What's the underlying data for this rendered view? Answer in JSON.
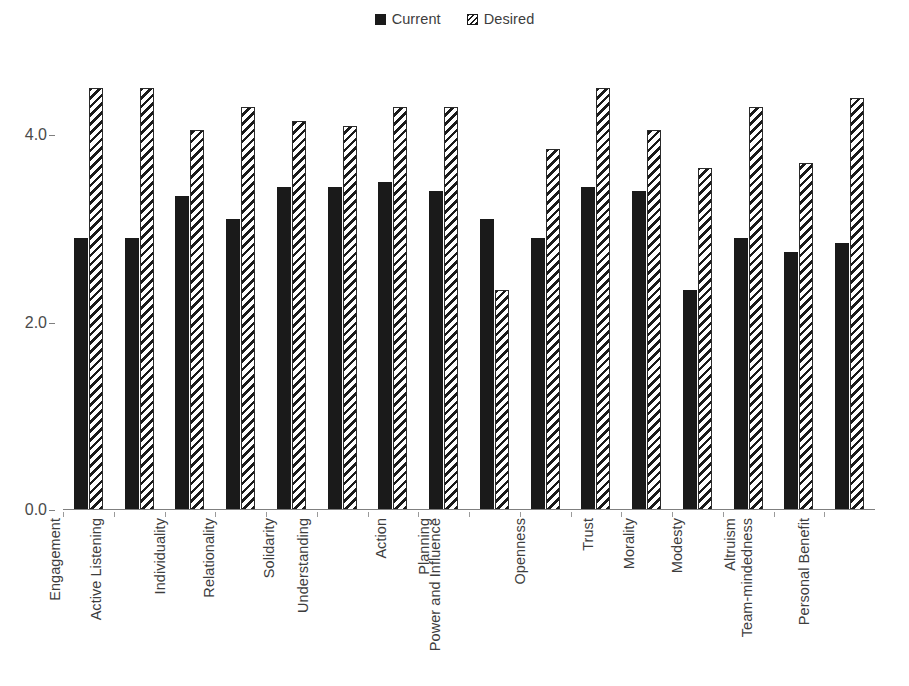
{
  "legend": {
    "position": "top-center",
    "entries": [
      {
        "label": "Current",
        "swatch": "solid-black-square-icon",
        "color": "#1a1a1a"
      },
      {
        "label": "Desired",
        "swatch": "diagonal-hatch-square-icon",
        "color": "#1a1a1a"
      }
    ]
  },
  "axis": {
    "y_ticks": [
      "0.0",
      "2.0",
      "4.0"
    ],
    "y_tick_values": [
      0.0,
      2.0,
      4.0
    ]
  },
  "chart_data": {
    "type": "bar",
    "title": "",
    "subtitle": "",
    "xlabel": "",
    "ylabel": "",
    "ylim": [
      0.0,
      4.8
    ],
    "grid": false,
    "legend_position": "top-center",
    "categories": [
      "Engagement",
      "Active Listening",
      "Individuality",
      "Relationality",
      "Solidarity",
      "Understanding",
      "Action",
      "Planning",
      "Power and Influence",
      "Openness",
      "Trust",
      "Morality",
      "Modesty",
      "Altruism",
      "Team-mindedness",
      "Personal Benefit"
    ],
    "series": [
      {
        "name": "Current",
        "style": "solid",
        "color": "#1a1a1a",
        "values": [
          2.9,
          2.9,
          3.35,
          3.1,
          3.45,
          3.45,
          3.5,
          3.4,
          3.1,
          2.9,
          3.45,
          3.4,
          2.35,
          2.9,
          2.75,
          2.85
        ]
      },
      {
        "name": "Desired",
        "style": "hatched",
        "color": "#1a1a1a",
        "values": [
          4.5,
          4.5,
          4.05,
          4.3,
          4.15,
          4.1,
          4.3,
          4.3,
          2.35,
          3.85,
          4.5,
          4.05,
          3.65,
          4.3,
          3.7,
          4.4
        ]
      }
    ],
    "y_ticks": [
      0.0,
      2.0,
      4.0
    ],
    "y_tick_labels": [
      "0.0",
      "2.0",
      "4.0"
    ]
  }
}
